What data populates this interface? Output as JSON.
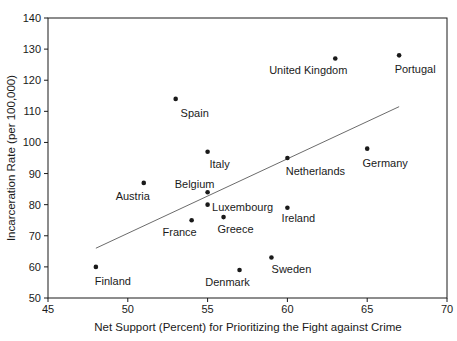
{
  "figure": {
    "background_color": "#ffffff",
    "text_color": "#1a1a1a"
  },
  "chart_data": {
    "type": "scatter",
    "title": "",
    "xlabel": "Net Support (Percent) for Prioritizing the Fight against Crime",
    "ylabel": "Incarceration Rate (per 100,000)",
    "xlim": [
      45,
      70
    ],
    "ylim": [
      50,
      140
    ],
    "x_ticks": [
      45,
      50,
      55,
      60,
      65,
      70
    ],
    "y_ticks": [
      50,
      60,
      70,
      80,
      90,
      100,
      110,
      120,
      130,
      140
    ],
    "grid": false,
    "legend": "none",
    "marker_color": "#1a1a1a",
    "axis_color": "#1a1a1a",
    "trend_color": "#5a5a5a",
    "points": [
      {
        "country": "Finland",
        "x": 48,
        "y": 60,
        "label_dx": 17,
        "label_dy": 18
      },
      {
        "country": "Austria",
        "x": 51,
        "y": 87,
        "label_dx": -11,
        "label_dy": 17
      },
      {
        "country": "Spain",
        "x": 53,
        "y": 114,
        "label_dx": 19,
        "label_dy": 18
      },
      {
        "country": "France",
        "x": 54,
        "y": 75,
        "label_dx": -12,
        "label_dy": 16
      },
      {
        "country": "Belgium",
        "x": 55,
        "y": 84,
        "label_dx": -13,
        "label_dy": -4
      },
      {
        "country": "Luxembourg",
        "x": 55,
        "y": 80,
        "label_dx": 35,
        "label_dy": 6
      },
      {
        "country": "Italy",
        "x": 55,
        "y": 97,
        "label_dx": 12,
        "label_dy": 16
      },
      {
        "country": "Greece",
        "x": 56,
        "y": 76,
        "label_dx": 12,
        "label_dy": 16
      },
      {
        "country": "Denmark",
        "x": 57,
        "y": 59,
        "label_dx": -12,
        "label_dy": 16
      },
      {
        "country": "Sweden",
        "x": 59,
        "y": 63,
        "label_dx": 20,
        "label_dy": 15
      },
      {
        "country": "Netherlands",
        "x": 60,
        "y": 95,
        "label_dx": 28,
        "label_dy": 17
      },
      {
        "country": "Ireland",
        "x": 60,
        "y": 79,
        "label_dx": 11,
        "label_dy": 14
      },
      {
        "country": "United Kingdom",
        "x": 63,
        "y": 127,
        "label_dx": -27,
        "label_dy": 16
      },
      {
        "country": "Germany",
        "x": 65,
        "y": 98,
        "label_dx": 18,
        "label_dy": 18
      },
      {
        "country": "Portugal",
        "x": 67,
        "y": 128,
        "label_dx": 16,
        "label_dy": 18
      }
    ],
    "trendline": {
      "x1": 48,
      "y1": 66,
      "x2": 67,
      "y2": 111.5
    }
  }
}
